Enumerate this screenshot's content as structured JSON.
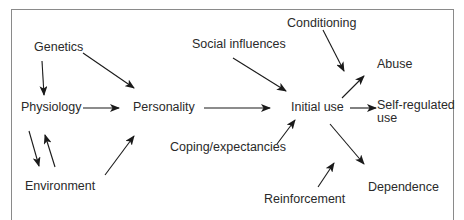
{
  "diagram": {
    "nodes": {
      "genetics": "Genetics",
      "physiology": "Physiology",
      "environment": "Environment",
      "personality": "Personality",
      "social_influences": "Social influences",
      "coping_expectancies": "Coping/expectancies",
      "initial_use": "Initial use",
      "conditioning": "Conditioning",
      "abuse": "Abuse",
      "self_regulated_line1": "Self-regulated",
      "self_regulated_line2": "use",
      "reinforcement": "Reinforcement",
      "dependence": "Dependence"
    },
    "edges": [
      {
        "from": "Genetics",
        "to": "Physiology"
      },
      {
        "from": "Genetics",
        "to": "Personality"
      },
      {
        "from": "Physiology",
        "to": "Personality"
      },
      {
        "from": "Physiology",
        "to": "Environment"
      },
      {
        "from": "Environment",
        "to": "Physiology"
      },
      {
        "from": "Environment",
        "to": "Personality"
      },
      {
        "from": "Personality",
        "to": "Initial use"
      },
      {
        "from": "Social influences",
        "to": "Initial use"
      },
      {
        "from": "Coping/expectancies",
        "to": "Initial use"
      },
      {
        "from": "Conditioning",
        "to": "Abuse/Initial use"
      },
      {
        "from": "Initial use",
        "to": "Abuse"
      },
      {
        "from": "Initial use",
        "to": "Self-regulated use"
      },
      {
        "from": "Initial use",
        "to": "Dependence"
      },
      {
        "from": "Reinforcement",
        "to": "Initial use/Dependence"
      }
    ],
    "colors": {
      "text": "#2a2a2a",
      "arrow": "#1a1a1a",
      "frame": "#8a8a8a"
    }
  }
}
